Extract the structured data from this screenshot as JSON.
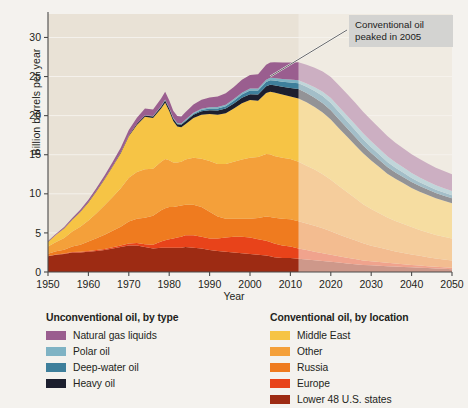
{
  "chart_data": {
    "type": "area",
    "title": "",
    "xlabel": "Year",
    "ylabel": "Billion barrels per year",
    "xlim": [
      1950,
      2050
    ],
    "ylim": [
      0,
      33
    ],
    "yticks": [
      0,
      5,
      10,
      15,
      20,
      25,
      30
    ],
    "xticks": [
      1950,
      1960,
      1970,
      1980,
      1990,
      2000,
      2010,
      2020,
      2030,
      2040,
      2050
    ],
    "grid": "horizontal",
    "stacked": true,
    "projection_start": 2012,
    "annotation": {
      "text": "Conventional oil peaked in 2005",
      "line1": "Conventional oil",
      "line2": "peaked in 2005",
      "points_to_year": 2005
    },
    "x": [
      1950,
      1952,
      1954,
      1956,
      1958,
      1960,
      1962,
      1964,
      1966,
      1968,
      1970,
      1972,
      1974,
      1976,
      1978,
      1979,
      1980,
      1981,
      1982,
      1983,
      1984,
      1986,
      1988,
      1990,
      1992,
      1994,
      1996,
      1998,
      2000,
      2002,
      2004,
      2005,
      2006,
      2008,
      2010,
      2012,
      2014,
      2016,
      2018,
      2020,
      2022,
      2024,
      2026,
      2028,
      2030,
      2032,
      2034,
      2036,
      2038,
      2040,
      2042,
      2044,
      2046,
      2048,
      2050
    ],
    "series": [
      {
        "name": "Lower 48 U.S. states",
        "group": "conventional",
        "color": "#9d2b13",
        "values": [
          2.0,
          2.2,
          2.3,
          2.5,
          2.5,
          2.6,
          2.7,
          2.8,
          3.0,
          3.2,
          3.4,
          3.4,
          3.2,
          3.0,
          3.1,
          3.1,
          3.1,
          3.1,
          3.1,
          3.1,
          3.2,
          3.1,
          3.0,
          2.8,
          2.7,
          2.6,
          2.5,
          2.4,
          2.3,
          2.2,
          2.1,
          2.0,
          1.9,
          1.8,
          1.8,
          1.7,
          1.6,
          1.5,
          1.4,
          1.3,
          1.2,
          1.1,
          1.0,
          0.9,
          0.85,
          0.8,
          0.75,
          0.7,
          0.65,
          0.6,
          0.55,
          0.5,
          0.45,
          0.4,
          0.35
        ]
      },
      {
        "name": "Europe",
        "group": "conventional",
        "color": "#e8431a",
        "values": [
          0.05,
          0.05,
          0.06,
          0.07,
          0.08,
          0.1,
          0.12,
          0.15,
          0.18,
          0.2,
          0.25,
          0.3,
          0.35,
          0.5,
          0.8,
          0.95,
          1.1,
          1.2,
          1.3,
          1.4,
          1.5,
          1.6,
          1.5,
          1.5,
          1.6,
          1.8,
          2.0,
          2.1,
          2.1,
          2.0,
          1.9,
          1.85,
          1.75,
          1.6,
          1.45,
          1.3,
          1.2,
          1.1,
          1.0,
          0.9,
          0.8,
          0.72,
          0.65,
          0.58,
          0.52,
          0.47,
          0.42,
          0.38,
          0.34,
          0.3,
          0.27,
          0.24,
          0.22,
          0.2,
          0.18
        ]
      },
      {
        "name": "Russia",
        "group": "conventional",
        "color": "#ef7b1f",
        "values": [
          0.3,
          0.4,
          0.5,
          0.7,
          0.9,
          1.2,
          1.5,
          1.8,
          2.1,
          2.4,
          2.8,
          3.1,
          3.4,
          3.7,
          4.0,
          4.1,
          4.1,
          4.0,
          4.0,
          4.0,
          3.9,
          3.9,
          3.8,
          3.4,
          2.8,
          2.4,
          2.3,
          2.3,
          2.4,
          2.7,
          3.1,
          3.2,
          3.3,
          3.4,
          3.5,
          3.5,
          3.4,
          3.3,
          3.2,
          3.0,
          2.8,
          2.6,
          2.4,
          2.2,
          2.0,
          1.85,
          1.7,
          1.55,
          1.45,
          1.35,
          1.25,
          1.15,
          1.05,
          1.0,
          0.95
        ]
      },
      {
        "name": "Other",
        "group": "conventional",
        "color": "#f4a03a",
        "values": [
          0.9,
          1.2,
          1.5,
          1.9,
          2.3,
          2.7,
          3.2,
          3.8,
          4.3,
          4.9,
          5.6,
          6.0,
          6.2,
          6.0,
          6.2,
          6.3,
          6.0,
          5.7,
          5.6,
          5.6,
          5.8,
          6.0,
          6.2,
          6.5,
          6.7,
          7.0,
          7.3,
          7.6,
          7.8,
          7.8,
          8.0,
          8.0,
          7.9,
          7.8,
          7.7,
          7.6,
          7.4,
          7.2,
          6.9,
          6.6,
          6.2,
          5.8,
          5.4,
          5.0,
          4.7,
          4.4,
          4.1,
          3.9,
          3.7,
          3.5,
          3.3,
          3.15,
          3.0,
          2.9,
          2.8
        ]
      },
      {
        "name": "Middle East",
        "group": "conventional",
        "color": "#f6c445",
        "values": [
          0.6,
          0.9,
          1.2,
          1.5,
          1.9,
          2.3,
          2.8,
          3.3,
          3.9,
          4.5,
          5.3,
          6.0,
          6.7,
          6.5,
          6.8,
          7.2,
          6.3,
          5.3,
          4.6,
          4.4,
          4.5,
          5.1,
          5.6,
          6.0,
          6.3,
          6.5,
          6.8,
          7.2,
          7.4,
          7.2,
          7.8,
          8.0,
          8.1,
          8.1,
          8.0,
          8.1,
          8.1,
          8.0,
          7.9,
          7.7,
          7.4,
          7.1,
          6.8,
          6.5,
          6.2,
          5.9,
          5.6,
          5.4,
          5.2,
          5.0,
          4.9,
          4.8,
          4.7,
          4.6,
          4.5
        ]
      },
      {
        "name": "Heavy oil",
        "group": "unconventional",
        "color": "#1c1f2e",
        "values": [
          0.02,
          0.02,
          0.03,
          0.03,
          0.04,
          0.05,
          0.06,
          0.07,
          0.08,
          0.1,
          0.12,
          0.15,
          0.18,
          0.2,
          0.25,
          0.3,
          0.3,
          0.3,
          0.3,
          0.32,
          0.35,
          0.4,
          0.45,
          0.5,
          0.55,
          0.6,
          0.65,
          0.7,
          0.75,
          0.8,
          0.85,
          0.9,
          0.95,
          1.0,
          1.1,
          1.2,
          1.2,
          1.2,
          1.2,
          1.2,
          1.15,
          1.1,
          1.05,
          1.0,
          0.95,
          0.9,
          0.85,
          0.8,
          0.78,
          0.75,
          0.72,
          0.7,
          0.68,
          0.66,
          0.65
        ]
      },
      {
        "name": "Deep-water oil",
        "group": "unconventional",
        "color": "#3e7f9b",
        "values": [
          0,
          0,
          0,
          0,
          0,
          0,
          0,
          0,
          0,
          0,
          0,
          0.01,
          0.02,
          0.03,
          0.05,
          0.06,
          0.07,
          0.08,
          0.09,
          0.1,
          0.12,
          0.15,
          0.18,
          0.22,
          0.26,
          0.3,
          0.35,
          0.4,
          0.45,
          0.5,
          0.55,
          0.58,
          0.6,
          0.65,
          0.7,
          0.75,
          0.8,
          0.85,
          0.9,
          0.92,
          0.9,
          0.88,
          0.85,
          0.8,
          0.75,
          0.7,
          0.65,
          0.6,
          0.56,
          0.52,
          0.48,
          0.45,
          0.42,
          0.4,
          0.38
        ]
      },
      {
        "name": "Polar oil",
        "group": "unconventional",
        "color": "#7fb3c4",
        "values": [
          0,
          0,
          0,
          0,
          0,
          0,
          0,
          0,
          0,
          0,
          0,
          0,
          0.01,
          0.02,
          0.03,
          0.04,
          0.05,
          0.06,
          0.07,
          0.08,
          0.1,
          0.12,
          0.14,
          0.16,
          0.18,
          0.2,
          0.22,
          0.24,
          0.26,
          0.28,
          0.3,
          0.31,
          0.32,
          0.34,
          0.36,
          0.38,
          0.42,
          0.48,
          0.55,
          0.62,
          0.68,
          0.72,
          0.75,
          0.76,
          0.76,
          0.74,
          0.72,
          0.7,
          0.68,
          0.65,
          0.62,
          0.6,
          0.58,
          0.56,
          0.55
        ]
      },
      {
        "name": "Natural gas liquids",
        "group": "unconventional",
        "color": "#9a5e8f",
        "values": [
          0.1,
          0.13,
          0.16,
          0.2,
          0.25,
          0.3,
          0.36,
          0.42,
          0.5,
          0.58,
          0.68,
          0.78,
          0.85,
          0.85,
          0.95,
          1.0,
          0.95,
          0.9,
          0.88,
          0.9,
          0.95,
          1.05,
          1.15,
          1.25,
          1.35,
          1.45,
          1.55,
          1.65,
          1.75,
          1.8,
          1.9,
          1.95,
          2.0,
          2.1,
          2.2,
          2.3,
          2.4,
          2.5,
          2.6,
          2.7,
          2.75,
          2.78,
          2.78,
          2.75,
          2.7,
          2.65,
          2.6,
          2.5,
          2.45,
          2.4,
          2.35,
          2.3,
          2.25,
          2.2,
          2.15
        ]
      }
    ],
    "totals_note": {
      "1950": 4.0,
      "1973": 21.6,
      "1979": 23.0,
      "1983": 19.3,
      "2005": 27.6,
      "2012": 28.9,
      "2026": 31.9,
      "2050": 14.3
    }
  },
  "axis": {
    "y_title": "Billion barrels per year",
    "x_title": "Year",
    "yticks": [
      "0",
      "5",
      "10",
      "15",
      "20",
      "25",
      "30"
    ],
    "xticks": [
      "1950",
      "1960",
      "1970",
      "1980",
      "1990",
      "2000",
      "2010",
      "2020",
      "2030",
      "2040",
      "2050"
    ]
  },
  "annotation": {
    "line1": "Conventional oil",
    "line2": "peaked in 2005"
  },
  "legend": {
    "left": {
      "title": "Unconventional oil, by type",
      "items": [
        {
          "label": "Natural gas liquids",
          "color": "#9a5e8f"
        },
        {
          "label": "Polar oil",
          "color": "#7fb3c4"
        },
        {
          "label": "Deep-water oil",
          "color": "#3e7f9b"
        },
        {
          "label": "Heavy oil",
          "color": "#1c1f2e"
        }
      ]
    },
    "right": {
      "title": "Conventional oil, by location",
      "items": [
        {
          "label": "Middle East",
          "color": "#f6c445"
        },
        {
          "label": "Other",
          "color": "#f4a03a"
        },
        {
          "label": "Russia",
          "color": "#ef7b1f"
        },
        {
          "label": "Europe",
          "color": "#e8431a"
        },
        {
          "label": "Lower 48 U.S. states",
          "color": "#9d2b13"
        }
      ]
    }
  },
  "colors": {
    "page_bg": "#f4f2ee",
    "plot_bg": "#e9e2d6",
    "projection_overlay": "#f5f2ec",
    "axis": "#4a4a4a",
    "callout_bg": "#d3d3d1",
    "text": "#231f20"
  }
}
